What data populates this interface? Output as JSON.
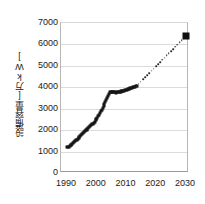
{
  "chart_data": {
    "type": "scatter",
    "title": "",
    "subtitle": "",
    "xlabel": "",
    "ylabel": "設備容量[万kW]",
    "xlim": [
      1988,
      2031
    ],
    "ylim": [
      0,
      7000
    ],
    "grid": true,
    "legend": null,
    "y_ticks": [
      0,
      1000,
      2000,
      3000,
      4000,
      5000,
      6000,
      7000
    ],
    "y_tick_labels": [
      "0",
      "1000",
      "2000",
      "3000",
      "4000",
      "5000",
      "6000",
      "7000"
    ],
    "x_ticks": [
      1990,
      2000,
      2010,
      2020,
      2030
    ],
    "x_tick_labels": [
      "1990",
      "2000",
      "2010",
      "2020",
      "2030"
    ],
    "series": [
      {
        "name": "actual",
        "style": "solid-markers",
        "marker": "square",
        "color": "#161616",
        "x": [
          1990.0,
          1990.3,
          1990.6,
          1990.9,
          1991.2,
          1991.5,
          1991.8,
          1992.1,
          1992.4,
          1992.7,
          1993.0,
          1993.3,
          1993.6,
          1993.9,
          1994.2,
          1994.5,
          1994.8,
          1995.1,
          1995.4,
          1995.7,
          1996.0,
          1996.3,
          1996.6,
          1996.9,
          1997.2,
          1997.5,
          1997.8,
          1998.1,
          1998.4,
          1998.7,
          1999.0,
          1999.3,
          1999.6,
          1999.9,
          2000.2,
          2000.5,
          2000.8,
          2001.1,
          2001.4,
          2001.7,
          2002.0,
          2002.3,
          2002.6,
          2002.9,
          2003.2,
          2003.5,
          2003.8,
          2004.1,
          2004.4,
          2004.7,
          2005.0,
          2005.3,
          2005.6,
          2005.9,
          2006.2,
          2006.5,
          2006.8,
          2007.1,
          2007.4,
          2007.7,
          2008.0,
          2008.3,
          2008.6,
          2008.9,
          2009.2,
          2009.5,
          2009.8,
          2010.1,
          2010.4,
          2010.7,
          2011.0,
          2011.3,
          2011.6,
          2011.9,
          2012.2,
          2012.5,
          2012.8,
          2013.1,
          2013.4
        ],
        "y": [
          1200,
          1215,
          1235,
          1260,
          1290,
          1325,
          1360,
          1400,
          1440,
          1480,
          1520,
          1560,
          1600,
          1645,
          1690,
          1730,
          1770,
          1810,
          1855,
          1900,
          1950,
          1990,
          2030,
          2070,
          2110,
          2160,
          2210,
          2250,
          2280,
          2310,
          2350,
          2400,
          2460,
          2520,
          2590,
          2660,
          2730,
          2800,
          2880,
          2960,
          3040,
          3120,
          3210,
          3300,
          3400,
          3500,
          3600,
          3700,
          3760,
          3790,
          3800,
          3795,
          3780,
          3770,
          3760,
          3755,
          3760,
          3770,
          3780,
          3790,
          3800,
          3810,
          3820,
          3830,
          3845,
          3860,
          3875,
          3890,
          3905,
          3920,
          3935,
          3950,
          3965,
          3980,
          4000,
          4015,
          4030,
          4045,
          4060
        ]
      },
      {
        "name": "projection",
        "style": "dotted",
        "marker": "none",
        "color": "#2a2a2a",
        "x": [
          2013.4,
          2030.0
        ],
        "y": [
          4060,
          6400
        ]
      },
      {
        "name": "target-2030",
        "style": "single-marker",
        "marker": "large-square",
        "color": "#111111",
        "x": [
          2030.0
        ],
        "y": [
          6400
        ]
      }
    ],
    "annotations": []
  }
}
